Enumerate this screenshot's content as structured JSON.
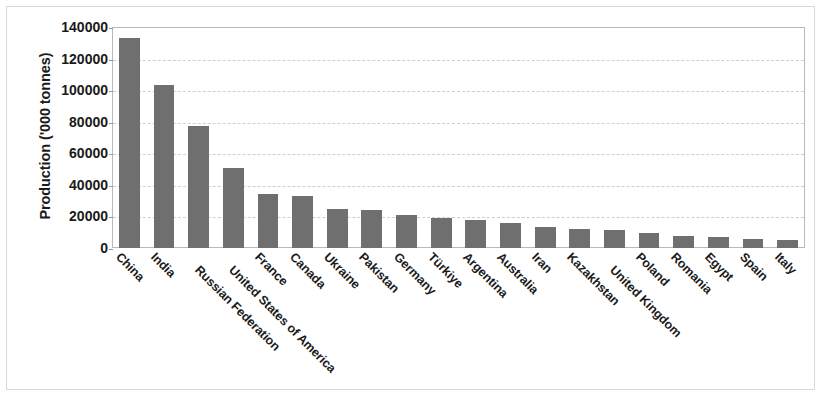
{
  "chart_data": {
    "type": "bar",
    "title": "",
    "subtitle": "",
    "xlabel": "",
    "ylabel": "Production ('000 tonnes)",
    "ylim": [
      0,
      140000
    ],
    "ytick_labels": [
      "140000",
      "120000",
      "100000",
      "80000",
      "60000",
      "40000",
      "20000",
      "0"
    ],
    "ytick_values": [
      140000,
      120000,
      100000,
      80000,
      60000,
      40000,
      20000,
      0
    ],
    "ytick_step": 20000,
    "grid": "horizontal-dashed",
    "legend": "none",
    "bar_color": "#6f6f6f",
    "categories": [
      "China",
      "India",
      "Russian Federation",
      "United States of America",
      "France",
      "Canada",
      "Ukraine",
      "Pakistan",
      "Germany",
      "Türkiye",
      "Argentina",
      "Australia",
      "Iran",
      "Kazakhstan",
      "United Kingdom",
      "Poland",
      "Romania",
      "Egypt",
      "Spain",
      "Italy"
    ],
    "values": [
      133000,
      103000,
      77000,
      51000,
      34500,
      33000,
      25000,
      24000,
      21000,
      19000,
      18000,
      16000,
      13000,
      12000,
      11500,
      9500,
      7500,
      7200,
      6000,
      5200
    ]
  },
  "colors": {
    "bar": "#6f6f6f",
    "text": "#1a1a1a",
    "gridline": "#cfcfcf",
    "plot_border": "#b9b9b9",
    "outer_border": "#d8d8d8",
    "background": "#ffffff"
  }
}
